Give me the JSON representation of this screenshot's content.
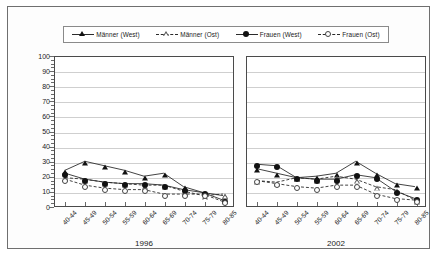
{
  "chart_data": {
    "type": "line",
    "title": "",
    "xlabel": "",
    "ylabel": "",
    "ylim": [
      0,
      100
    ],
    "ytick_step": 10,
    "yticks": [
      100,
      90,
      80,
      70,
      60,
      50,
      40,
      30,
      20,
      10,
      0
    ],
    "grid": true,
    "legend_position": "top",
    "categories": [
      "40-44",
      "45-49",
      "50-54",
      "55-59",
      "60-64",
      "65-69",
      "70-74",
      "75-79",
      "80-85"
    ],
    "panels": [
      {
        "name": "1996",
        "label": "1996",
        "series": [
          {
            "name": "Männer (West)",
            "marker": "tri-f",
            "line": "solid",
            "values": [
              24,
              30,
              27,
              24,
              20,
              22,
              13,
              9,
              7
            ]
          },
          {
            "name": "Männer (Ost)",
            "marker": "tri-o",
            "line": "dashed",
            "values": [
              19,
              18,
              16,
              15,
              14,
              14,
              10,
              7,
              8
            ]
          },
          {
            "name": "Frauen (West)",
            "marker": "cir-f",
            "line": "solid",
            "values": [
              22,
              18,
              16,
              15,
              15,
              14,
              11,
              9,
              4
            ]
          },
          {
            "name": "Frauen (Ost)",
            "marker": "cir-o",
            "line": "dashed",
            "values": [
              18,
              14,
              12,
              11,
              11,
              8,
              8,
              8,
              3
            ]
          }
        ]
      },
      {
        "name": "2002",
        "label": "2002",
        "series": [
          {
            "name": "Männer (West)",
            "marker": "tri-f",
            "line": "solid",
            "values": [
              25,
              22,
              19,
              20,
              22,
              30,
              22,
              15,
              13
            ]
          },
          {
            "name": "Männer (Ost)",
            "marker": "tri-o",
            "line": "dashed",
            "values": [
              17,
              16,
              19,
              18,
              20,
              18,
              13,
              11,
              4
            ]
          },
          {
            "name": "Frauen (West)",
            "marker": "cir-f",
            "line": "solid",
            "values": [
              28,
              27,
              19,
              18,
              18,
              21,
              19,
              10,
              5
            ]
          },
          {
            "name": "Frauen (Ost)",
            "marker": "cir-o",
            "line": "dashed",
            "values": [
              17,
              15,
              13,
              12,
              14,
              14,
              8,
              5,
              4
            ]
          }
        ]
      }
    ],
    "legend": [
      {
        "label": "Männer (West)",
        "marker": "tri-f",
        "line": "solid"
      },
      {
        "label": "Männer (Ost)",
        "marker": "tri-o",
        "line": "dashed"
      },
      {
        "label": "Frauen (West)",
        "marker": "cir-f",
        "line": "solid"
      },
      {
        "label": "Frauen (Ost)",
        "marker": "cir-o",
        "line": "dashed"
      }
    ],
    "colors": {
      "line": "#2b2b2b",
      "grid": "#cfcfcf",
      "axis": "#3a3a3a",
      "text": "#1a1a1a"
    }
  }
}
